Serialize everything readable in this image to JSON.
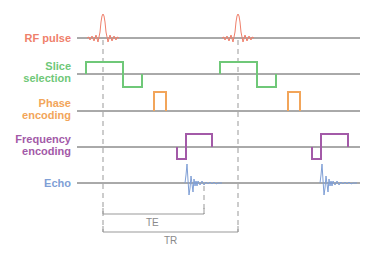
{
  "diagram": {
    "colors": {
      "rf": "#ef7f6b",
      "slice": "#6fc878",
      "phase": "#f2a55a",
      "frequency": "#a35aa8",
      "echo": "#7f9fd6",
      "axis": "#555555",
      "timing": "#999999"
    },
    "channels": [
      {
        "key": "rf",
        "label_lines": [
          "RF pulse"
        ],
        "color": "#ef7f6b"
      },
      {
        "key": "slice",
        "label_lines": [
          "Slice",
          "selection"
        ],
        "color": "#6fc878"
      },
      {
        "key": "phase",
        "label_lines": [
          "Phase",
          "encoding"
        ],
        "color": "#f2a55a"
      },
      {
        "key": "frequency",
        "label_lines": [
          "Frequency",
          "encoding"
        ],
        "color": "#a35aa8"
      },
      {
        "key": "echo",
        "label_lines": [
          "Echo"
        ],
        "color": "#7f9fd6"
      }
    ],
    "timing": {
      "te_label": "TE",
      "tr_label": "TR"
    }
  }
}
